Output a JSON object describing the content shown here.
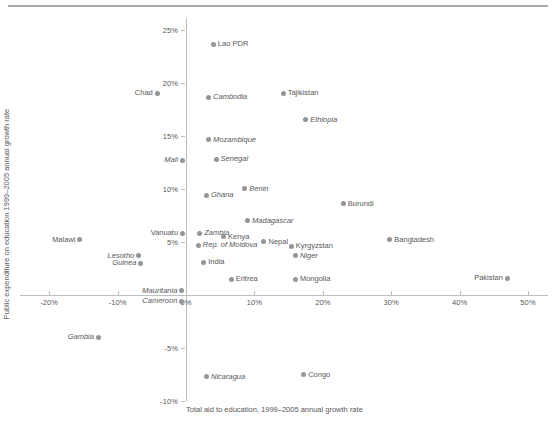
{
  "figure": {
    "top_rule": "horizontal-divider"
  },
  "chart_data": {
    "type": "scatter",
    "title": "",
    "xlabel": "Total aid to education, 1999–2005 annual growth rate",
    "ylabel": "Public expenditure on education 1999–2005 annual growth rate",
    "xlim": [
      -20,
      50
    ],
    "ylim": [
      -10,
      25
    ],
    "xticks": [
      -20,
      -10,
      0,
      10,
      20,
      30,
      40,
      50
    ],
    "xtick_labels": [
      "-20%",
      "-10%",
      "0%",
      "10%",
      "20%",
      "30%",
      "40%",
      "50%"
    ],
    "yticks": [
      -10,
      -5,
      0,
      5,
      10,
      15,
      20,
      25
    ],
    "ytick_labels": [
      "-10%",
      "-5%",
      "0%",
      "5%",
      "10%",
      "15%",
      "20%",
      "25%"
    ],
    "grid": false,
    "legend": null,
    "marker_color": "#939598",
    "points": [
      {
        "name": "Lao PDR",
        "x": 4.0,
        "y": 23.6,
        "label_side": "right",
        "italic": false
      },
      {
        "name": "Chad",
        "x": -4.2,
        "y": 19.0,
        "label_side": "left",
        "italic": false
      },
      {
        "name": "Cambodia",
        "x": 3.3,
        "y": 18.6,
        "label_side": "right",
        "italic": true
      },
      {
        "name": "Tajikistan",
        "x": 14.2,
        "y": 19.0,
        "label_side": "right",
        "italic": false
      },
      {
        "name": "Ethiopia",
        "x": 17.5,
        "y": 16.5,
        "label_side": "right",
        "italic": true
      },
      {
        "name": "Mozambique",
        "x": 3.3,
        "y": 14.6,
        "label_side": "right",
        "italic": true
      },
      {
        "name": "Mali",
        "x": -0.5,
        "y": 12.7,
        "label_side": "left",
        "italic": true
      },
      {
        "name": "Senegal",
        "x": 4.4,
        "y": 12.8,
        "label_side": "right",
        "italic": true
      },
      {
        "name": "Benin",
        "x": 8.6,
        "y": 10.0,
        "label_side": "right",
        "italic": true
      },
      {
        "name": "Ghana",
        "x": 3.0,
        "y": 9.4,
        "label_side": "right",
        "italic": true
      },
      {
        "name": "Burundi",
        "x": 23.0,
        "y": 8.6,
        "label_side": "right",
        "italic": false
      },
      {
        "name": "Madagascar",
        "x": 9.0,
        "y": 7.0,
        "label_side": "right",
        "italic": true
      },
      {
        "name": "Vanuatu",
        "x": -0.5,
        "y": 5.8,
        "label_side": "left",
        "italic": false
      },
      {
        "name": "Zambia",
        "x": 2.0,
        "y": 5.8,
        "label_side": "right",
        "italic": true
      },
      {
        "name": "Kenya",
        "x": 5.5,
        "y": 5.5,
        "label_side": "right",
        "italic": false
      },
      {
        "name": "Nepal",
        "x": 11.4,
        "y": 5.0,
        "label_side": "right",
        "italic": false
      },
      {
        "name": "Kyrgyzstan",
        "x": 15.4,
        "y": 4.6,
        "label_side": "right",
        "italic": false
      },
      {
        "name": "Bangladesh",
        "x": 29.8,
        "y": 5.2,
        "label_side": "right",
        "italic": false
      },
      {
        "name": "Rep. of Moldova",
        "x": 1.8,
        "y": 4.7,
        "label_side": "right",
        "italic": true
      },
      {
        "name": "Niger",
        "x": 16.0,
        "y": 3.7,
        "label_side": "right",
        "italic": true
      },
      {
        "name": "Malawi",
        "x": -15.5,
        "y": 5.2,
        "label_side": "left",
        "italic": false
      },
      {
        "name": "Lesotho",
        "x": -6.9,
        "y": 3.7,
        "label_side": "left",
        "italic": true
      },
      {
        "name": "Guinea",
        "x": -6.6,
        "y": 3.0,
        "label_side": "left",
        "italic": true
      },
      {
        "name": "India",
        "x": 2.6,
        "y": 3.1,
        "label_side": "right",
        "italic": false
      },
      {
        "name": "Eritrea",
        "x": 6.6,
        "y": 1.5,
        "label_side": "right",
        "italic": false
      },
      {
        "name": "Mongolia",
        "x": 16.0,
        "y": 1.5,
        "label_side": "right",
        "italic": false
      },
      {
        "name": "Mauritania",
        "x": -0.6,
        "y": 0.4,
        "label_side": "left",
        "italic": true
      },
      {
        "name": "Pakistan",
        "x": 47.0,
        "y": 1.6,
        "label_side": "left",
        "italic": false
      },
      {
        "name": "Cameroon",
        "x": -0.6,
        "y": -0.6,
        "label_side": "left",
        "italic": true
      },
      {
        "name": "Gambia",
        "x": -12.8,
        "y": -4.0,
        "label_side": "left",
        "italic": true
      },
      {
        "name": "Nicaragua",
        "x": 3.0,
        "y": -7.7,
        "label_side": "right",
        "italic": true
      },
      {
        "name": "Congo",
        "x": 17.2,
        "y": -7.5,
        "label_side": "right",
        "italic": false
      }
    ]
  }
}
